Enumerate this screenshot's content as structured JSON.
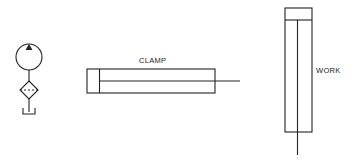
{
  "diagram": {
    "type": "hydraulic-schematic",
    "components": [
      {
        "id": "pump",
        "symbol": "hydraulic-pump",
        "label": ""
      },
      {
        "id": "filter",
        "symbol": "filter",
        "label": ""
      },
      {
        "id": "tank",
        "symbol": "reservoir",
        "label": ""
      },
      {
        "id": "clamp",
        "symbol": "double-acting-cylinder",
        "orientation": "horizontal",
        "label": "CLAMP"
      },
      {
        "id": "work",
        "symbol": "double-acting-cylinder",
        "orientation": "vertical",
        "label": "WORK"
      }
    ],
    "labels": {
      "clamp": "CLAMP",
      "work": "WORK"
    },
    "colors": {
      "line": "#222222",
      "background": "#ffffff"
    }
  }
}
